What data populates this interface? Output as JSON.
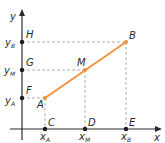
{
  "diagram": {
    "axes": {
      "x_label": "x",
      "y_label": "y"
    },
    "segment": {
      "from": "A",
      "to": "B",
      "midpoint": "M",
      "color": "#f0913a"
    },
    "points": [
      {
        "name": "A",
        "label": "A",
        "x": 45,
        "y": 98
      },
      {
        "name": "M",
        "label": "M",
        "x": 85,
        "y": 70
      },
      {
        "name": "B",
        "label": "B",
        "x": 126,
        "y": 42
      },
      {
        "name": "C",
        "label": "C",
        "x": 45,
        "y": 129
      },
      {
        "name": "D",
        "label": "D",
        "x": 85,
        "y": 129
      },
      {
        "name": "E",
        "label": "E",
        "x": 126,
        "y": 129
      },
      {
        "name": "F",
        "label": "F",
        "x": 22,
        "y": 98
      },
      {
        "name": "G",
        "label": "G",
        "x": 22,
        "y": 70
      },
      {
        "name": "H",
        "label": "H",
        "x": 22,
        "y": 42
      }
    ],
    "x_ticks": [
      {
        "main": "x",
        "sub": "A"
      },
      {
        "main": "x",
        "sub": "M"
      },
      {
        "main": "x",
        "sub": "B"
      }
    ],
    "y_ticks": [
      {
        "main": "y",
        "sub": "B"
      },
      {
        "main": "y",
        "sub": "M"
      },
      {
        "main": "y",
        "sub": "A"
      }
    ],
    "colors": {
      "segment": "#f0913a",
      "axis": "#2a2a2a",
      "dashed": "#b0b0b0"
    }
  }
}
